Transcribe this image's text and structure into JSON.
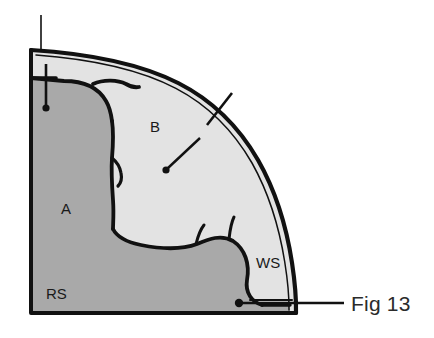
{
  "figure": {
    "caption": "Fig 13",
    "title": "Fig 13"
  },
  "colors": {
    "region_dark_fill": "#a9a9a9",
    "region_light_fill": "#e3e3e3",
    "outline": "#111111",
    "background": "#ffffff",
    "label_text": "#1a1a1a",
    "caption_text": "#2b2b2b"
  },
  "regions": [
    {
      "id": "region-a",
      "label": "A",
      "fill": "#a9a9a9",
      "label_x": 66,
      "label_y": 214
    },
    {
      "id": "region-b",
      "label": "B",
      "fill": "#e3e3e3",
      "label_x": 155,
      "label_y": 132
    },
    {
      "id": "region-rs",
      "label": "RS",
      "fill": "#a9a9a9",
      "label_x": 46,
      "label_y": 299
    },
    {
      "id": "region-ws",
      "label": "WS",
      "fill": "#e3e3e3",
      "label_x": 256,
      "label_y": 268
    }
  ],
  "leaders": [
    {
      "id": "leader-top-thin",
      "target": "top-left-corner",
      "has_dot": false
    },
    {
      "id": "leader-top-dot",
      "target": "region-a-upper",
      "has_dot": true,
      "dot_x": 46,
      "dot_y": 108
    },
    {
      "id": "leader-arc",
      "target": "outer-arc",
      "has_dot": false
    },
    {
      "id": "leader-b",
      "target": "region-b",
      "has_dot": true,
      "dot_x": 166,
      "dot_y": 170
    },
    {
      "id": "leader-bottom",
      "target": "bottom-right-seam",
      "has_dot": true,
      "dot_x": 239,
      "dot_y": 303
    }
  ]
}
